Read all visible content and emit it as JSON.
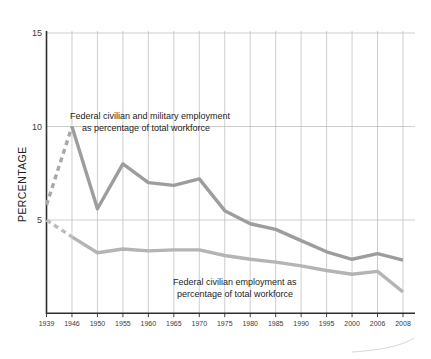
{
  "chart_data": {
    "type": "line",
    "title": "",
    "xlabel": "",
    "ylabel": "PERCENTAGE",
    "ylim": [
      0,
      15
    ],
    "yticks": [
      5,
      10,
      15
    ],
    "ytick_labels": [
      "5",
      "10",
      "15"
    ],
    "grid": true,
    "legend_position": "inline-annotations",
    "categories": [
      "1939",
      "1946",
      "1950",
      "1955",
      "1960",
      "1965",
      "1970",
      "1975",
      "1980",
      "1985",
      "1990",
      "1995",
      "2000",
      "2006",
      "2008"
    ],
    "x": [
      1939,
      1946,
      1950,
      1955,
      1960,
      1965,
      1970,
      1975,
      1980,
      1985,
      1990,
      1995,
      2000,
      2006,
      2008
    ],
    "series": [
      {
        "name": "Federal civilian and military employment as percentage of total workforce",
        "values": [
          5.8,
          10.0,
          5.6,
          8.0,
          7.0,
          6.85,
          7.2,
          5.5,
          4.8,
          4.5,
          3.9,
          3.3,
          2.9,
          3.2,
          2.85
        ],
        "dashed_from_index": 0,
        "dashed_to_index": 1,
        "color": "#9d9d9d"
      },
      {
        "name": "Federal civilian employment as percentage of total workforce",
        "values": [
          5.0,
          4.1,
          3.25,
          3.45,
          3.35,
          3.4,
          3.4,
          3.1,
          2.9,
          2.75,
          2.55,
          2.3,
          2.1,
          2.25,
          1.15
        ],
        "dashed_from_index": 0,
        "dashed_to_index": 1,
        "color": "#b4b4b4"
      }
    ],
    "annotations": [
      {
        "id": "upper-annotation",
        "lines": [
          "Federal civilian and military employment",
          "as percentage of total workforce"
        ]
      },
      {
        "id": "lower-annotation",
        "lines": [
          "Federal civilian employment as",
          "percentage of total workforce"
        ]
      }
    ]
  },
  "axis": {
    "y_title": "PERCENTAGE",
    "y_tick_0": "15",
    "y_tick_1": "10",
    "y_tick_2": "5",
    "x_tick_0": "1939",
    "x_tick_1": "1946",
    "x_tick_2": "1950",
    "x_tick_3": "1955",
    "x_tick_4": "1960",
    "x_tick_5": "1965",
    "x_tick_6": "1970",
    "x_tick_7": "1975",
    "x_tick_8": "1980",
    "x_tick_9": "1985",
    "x_tick_10": "1990",
    "x_tick_11": "1995",
    "x_tick_12": "2000",
    "x_tick_13": "2006",
    "x_tick_14": "2008"
  },
  "annotations": {
    "upper_line_1": "Federal civilian and military employment",
    "upper_line_2": "as percentage of total workforce",
    "lower_line_1": "Federal civilian employment as",
    "lower_line_2": "percentage of total workforce"
  },
  "colors": {
    "background": "#ffffff",
    "grid": "#b9b9b9",
    "axis": "#2e2e2e",
    "series_upper": "#9d9d9d",
    "series_lower": "#b4b4b4",
    "text": "#2a2a2a"
  }
}
